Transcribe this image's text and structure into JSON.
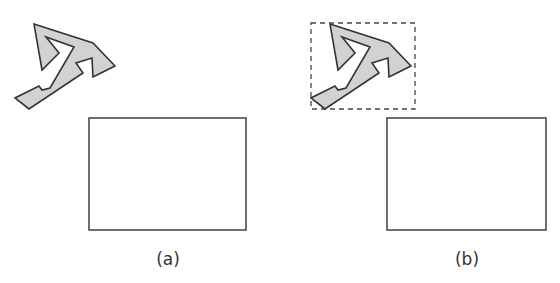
{
  "figure": {
    "panels": [
      {
        "id": "a",
        "label": "(a)",
        "shape": {
          "fill": "#d2d2d2",
          "stroke": "#333333",
          "offset_x": 0,
          "offset_y": 0,
          "bounding_box_shown": false
        },
        "rectangle": {
          "x": 89,
          "y": 118,
          "width": 157,
          "height": 112
        }
      },
      {
        "id": "b",
        "label": "(b)",
        "shape": {
          "fill": "#d2d2d2",
          "stroke": "#333333",
          "offset_x": 296,
          "offset_y": 0,
          "bounding_box_shown": true
        },
        "bounding_box": {
          "x": 311,
          "y": 23,
          "width": 104,
          "height": 86,
          "style": "dashed"
        },
        "rectangle": {
          "x": 387,
          "y": 118,
          "width": 159,
          "height": 112
        }
      }
    ],
    "colors": {
      "stroke": "#333333",
      "shape_fill": "#d2d2d2",
      "background": "#ffffff"
    }
  }
}
